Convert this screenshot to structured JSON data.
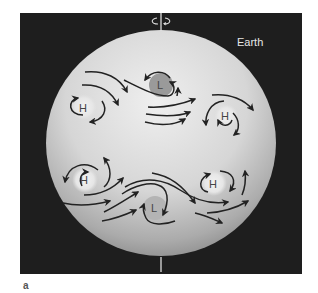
{
  "figure": {
    "planet_label": "Earth",
    "panel_label": "a",
    "rotation_icon": "rotation-arrow-icon",
    "colors": {
      "background": "#1e1e1e",
      "sphere_light": "#ededed",
      "sphere_dark": "#8f8f8f",
      "low_pressure_disk": "#9a9a9a",
      "high_pressure_disk": "#e4e4e4",
      "arrows": "#222222"
    },
    "pressure_systems": [
      {
        "id": "nh-high-west",
        "letter": "H",
        "hemisphere": "northern",
        "type": "high"
      },
      {
        "id": "nh-low-center",
        "letter": "L",
        "hemisphere": "northern",
        "type": "low"
      },
      {
        "id": "nh-high-east",
        "letter": "H",
        "hemisphere": "northern",
        "type": "high"
      },
      {
        "id": "sh-high-west",
        "letter": "H",
        "hemisphere": "southern",
        "type": "high"
      },
      {
        "id": "sh-low-center",
        "letter": "L",
        "hemisphere": "southern",
        "type": "low"
      },
      {
        "id": "sh-high-east",
        "letter": "H",
        "hemisphere": "southern",
        "type": "high"
      }
    ]
  }
}
